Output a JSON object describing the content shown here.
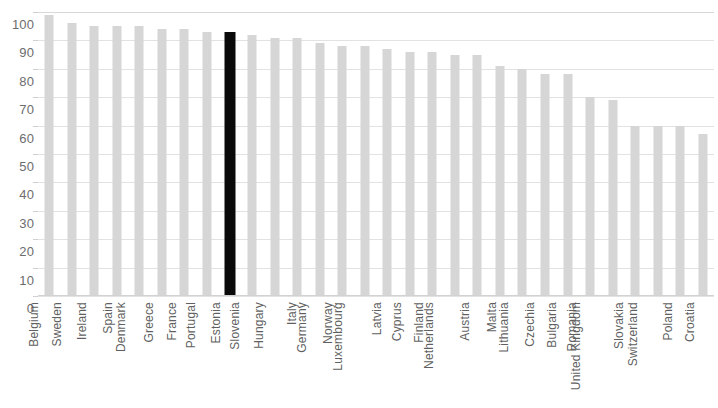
{
  "chart_data": {
    "type": "bar",
    "title": "",
    "subtitle": "",
    "xlabel": "",
    "ylabel": "",
    "ylim": [
      0,
      100
    ],
    "grid": true,
    "legend": "none",
    "y_ticks": [
      100,
      90,
      80,
      70,
      60,
      50,
      40,
      30,
      20,
      10,
      0
    ],
    "categories": [
      "Belgium",
      "Sweden",
      "Ireland",
      "Spain",
      "Denmark",
      "Greece",
      "France",
      "Portugal",
      "Estonia",
      "Slovenia",
      "Hungary",
      "Italy",
      "Germany",
      "Norway",
      "Luxembourg",
      "Latvia",
      "Cyprus",
      "Finland",
      "Netherlands",
      "Austria",
      "Malta",
      "Lithuania",
      "Czechia",
      "Bulgaria",
      "Romania",
      "United Kingdom",
      "Slovakia",
      "Switzerland",
      "Poland",
      "Croatia"
    ],
    "values": [
      99,
      96,
      95,
      95,
      95,
      94,
      94,
      93,
      93,
      92,
      91,
      91,
      89,
      88,
      88,
      87,
      86,
      86,
      85,
      85,
      81,
      80,
      78,
      78,
      70,
      69,
      60,
      60,
      60,
      57
    ],
    "highlight_category": "Estonia",
    "colors": {
      "bar": "#d6d6d6",
      "highlight_bar": "#0a0a0a",
      "gridline": "#e2e2e2",
      "tick_label": "#6d6d6d",
      "category_label": "#5f5f5f",
      "background": "#ffffff"
    }
  }
}
